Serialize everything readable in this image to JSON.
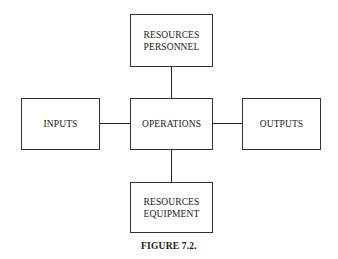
{
  "diagram": {
    "nodes": {
      "personnel": {
        "line1": "RESOURCES",
        "line2": "PERSONNEL"
      },
      "inputs": {
        "label": "INPUTS"
      },
      "operations": {
        "label": "OPERATIONS"
      },
      "outputs": {
        "label": "OUTPUTS"
      },
      "equipment": {
        "line1": "RESOURCES",
        "line2": "EQUIPMENT"
      }
    },
    "edges": [
      {
        "from": "personnel",
        "to": "operations"
      },
      {
        "from": "inputs",
        "to": "operations"
      },
      {
        "from": "operations",
        "to": "outputs"
      },
      {
        "from": "operations",
        "to": "equipment"
      }
    ],
    "caption": "FIGURE 7.2."
  }
}
